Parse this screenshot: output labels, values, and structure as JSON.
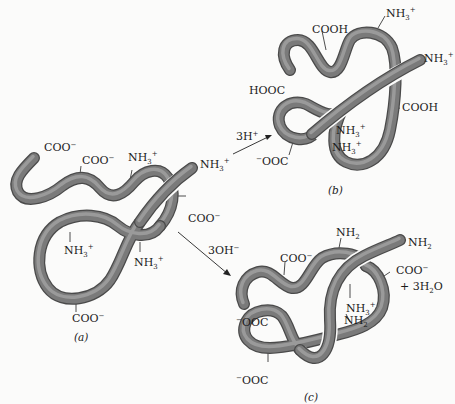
{
  "figure": {
    "panels": [
      {
        "id": "a",
        "caption": "(a)",
        "description": "Native protein chain at neutral pH",
        "labels": [
          "COO⁻",
          "COO⁻",
          "NH₃⁺",
          "NH₃⁺",
          "COO⁻",
          "NH₃⁺",
          "NH₃⁺",
          "COO⁻"
        ]
      },
      {
        "id": "b",
        "caption": "(b)",
        "description": "Protein after adding acid",
        "labels": [
          "COOH",
          "NH₃⁺",
          "NH₃⁺",
          "HOOC",
          "COOH",
          "NH₃⁺",
          "NH₃⁺",
          "⁻OOC"
        ]
      },
      {
        "id": "c",
        "caption": "(c)",
        "description": "Protein after adding base",
        "labels": [
          "NH₂",
          "NH₂",
          "COO⁻",
          "COO⁻",
          "+ 3H₂O",
          "NH₃⁺",
          "NH₂",
          "⁻OOC",
          "⁻OOC"
        ]
      }
    ],
    "arrows": [
      {
        "from": "a",
        "to": "b",
        "label": "3H⁺"
      },
      {
        "from": "a",
        "to": "c",
        "label": "3OH⁻"
      }
    ]
  },
  "text": {
    "a_coo1": "COO",
    "a_coo2": "COO",
    "a_nh3_1": "NH",
    "a_nh3_2": "NH",
    "a_coo3": "COO",
    "a_nh3_3": "NH",
    "a_nh3_4": "NH",
    "a_coo4": "COO",
    "cap_a": "(a)",
    "b_cooh1": "COOH",
    "b_nh3_1": "NH",
    "b_nh3_2": "NH",
    "b_hooc": "HOOC",
    "b_cooh2": "COOH",
    "b_nh3_3": "NH",
    "b_nh3_4": "NH",
    "b_ooc": "OOC",
    "cap_b": "(b)",
    "c_nh2_1": "NH",
    "c_nh2_2": "NH",
    "c_coo1": "COO",
    "c_coo2": "COO",
    "c_water": "+ 3H",
    "c_water_o": "O",
    "c_nh3": "NH",
    "c_nh2_3": "NH",
    "c_ooc1": "OOC",
    "c_ooc2": "OOC",
    "cap_c": "(c)",
    "arrow_acid": "3H",
    "arrow_base": "3OH",
    "sub3": "3",
    "sub2": "2",
    "plus": "+",
    "minus": "−"
  }
}
